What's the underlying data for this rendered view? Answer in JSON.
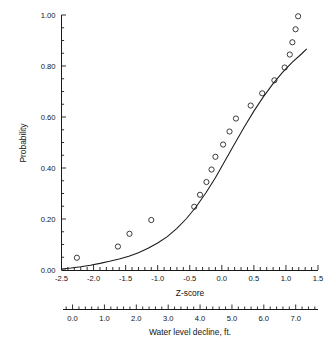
{
  "chart_data": {
    "type": "scatter",
    "title": "",
    "xlabel": "Z-score",
    "xlabel_secondary": "Water level decline, ft.",
    "ylabel": "Probability",
    "xlim": [
      -2.5,
      1.5
    ],
    "ylim": [
      0.0,
      1.0
    ],
    "xlim_secondary": [
      -0.3,
      7.7
    ],
    "grid": false,
    "legend": null,
    "xticks": [
      -2.5,
      -2.0,
      -1.5,
      -1.0,
      -0.5,
      0.0,
      0.5,
      1.0,
      1.5
    ],
    "xticklabels": [
      "-2.5",
      "-2.0",
      "-1.5",
      "-1.0",
      "-0.5",
      "0.0",
      "0.5",
      "1.0",
      "1.5"
    ],
    "yticks": [
      0.0,
      0.2,
      0.4,
      0.6,
      0.8,
      1.0
    ],
    "yticklabels": [
      "0.00",
      "0.20",
      "0.40",
      "0.60",
      "0.80",
      "1.00"
    ],
    "xticks_secondary": [
      0.0,
      1.0,
      2.0,
      3.0,
      4.0,
      5.0,
      6.0,
      7.0
    ],
    "xticklabels_secondary": [
      "0.0",
      "1.0",
      "2.0",
      "3.0",
      "4.0",
      "5.0",
      "6.0",
      "7.0"
    ],
    "x_minor_tick_interval": 0.1,
    "y_minor_tick_interval": 0.05,
    "series": [
      {
        "name": "Observed probability",
        "type": "scatter",
        "marker": "open-circle",
        "color": "#1a1a1a",
        "points": [
          {
            "x": -2.26,
            "y": 0.048
          },
          {
            "x": -1.62,
            "y": 0.092
          },
          {
            "x": -1.44,
            "y": 0.142
          },
          {
            "x": -1.1,
            "y": 0.196
          },
          {
            "x": -0.43,
            "y": 0.248
          },
          {
            "x": -0.34,
            "y": 0.295
          },
          {
            "x": -0.24,
            "y": 0.345
          },
          {
            "x": -0.16,
            "y": 0.394
          },
          {
            "x": -0.1,
            "y": 0.444
          },
          {
            "x": 0.02,
            "y": 0.492
          },
          {
            "x": 0.12,
            "y": 0.543
          },
          {
            "x": 0.22,
            "y": 0.594
          },
          {
            "x": 0.45,
            "y": 0.645
          },
          {
            "x": 0.63,
            "y": 0.693
          },
          {
            "x": 0.82,
            "y": 0.744
          },
          {
            "x": 0.98,
            "y": 0.794
          },
          {
            "x": 1.06,
            "y": 0.845
          },
          {
            "x": 1.1,
            "y": 0.893
          },
          {
            "x": 1.15,
            "y": 0.944
          },
          {
            "x": 1.19,
            "y": 0.995
          }
        ]
      },
      {
        "name": "Fitted curve",
        "type": "line",
        "color": "#1a1a1a",
        "points": [
          {
            "x": -2.5,
            "y": 0.004
          },
          {
            "x": -2.35,
            "y": 0.008
          },
          {
            "x": -2.2,
            "y": 0.013
          },
          {
            "x": -2.05,
            "y": 0.019
          },
          {
            "x": -1.9,
            "y": 0.026
          },
          {
            "x": -1.75,
            "y": 0.034
          },
          {
            "x": -1.6,
            "y": 0.043
          },
          {
            "x": -1.45,
            "y": 0.054
          },
          {
            "x": -1.3,
            "y": 0.068
          },
          {
            "x": -1.15,
            "y": 0.085
          },
          {
            "x": -1.0,
            "y": 0.106
          },
          {
            "x": -0.85,
            "y": 0.131
          },
          {
            "x": -0.7,
            "y": 0.163
          },
          {
            "x": -0.55,
            "y": 0.202
          },
          {
            "x": -0.4,
            "y": 0.248
          },
          {
            "x": -0.25,
            "y": 0.302
          },
          {
            "x": -0.1,
            "y": 0.362
          },
          {
            "x": 0.05,
            "y": 0.428
          },
          {
            "x": 0.2,
            "y": 0.495
          },
          {
            "x": 0.35,
            "y": 0.561
          },
          {
            "x": 0.5,
            "y": 0.623
          },
          {
            "x": 0.65,
            "y": 0.68
          },
          {
            "x": 0.8,
            "y": 0.731
          },
          {
            "x": 0.95,
            "y": 0.776
          },
          {
            "x": 1.1,
            "y": 0.815
          },
          {
            "x": 1.25,
            "y": 0.849
          },
          {
            "x": 1.32,
            "y": 0.866
          }
        ]
      }
    ]
  }
}
